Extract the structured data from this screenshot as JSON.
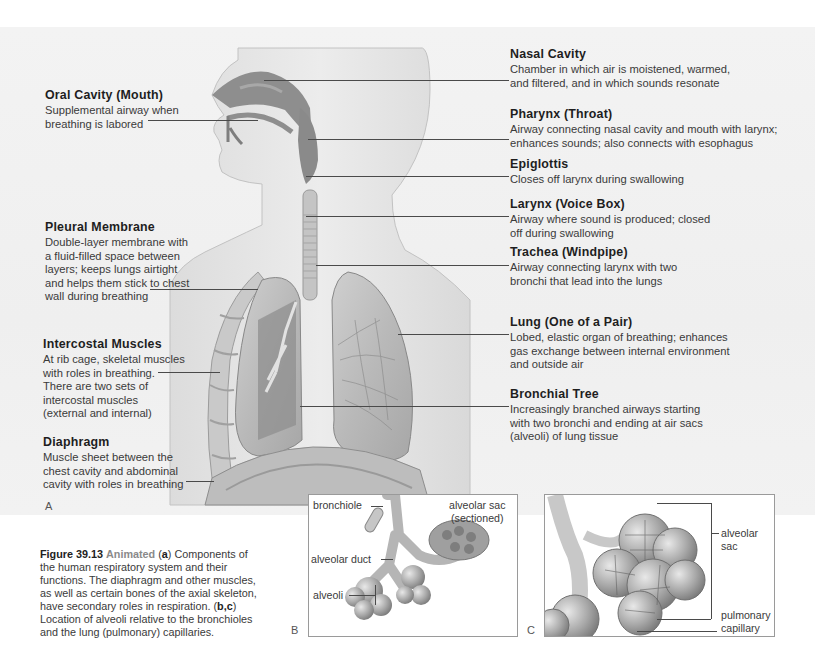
{
  "figure": {
    "number": "Figure 39.13",
    "tag": "Animated",
    "caption_parts": [
      {
        "text": "(",
        "bold": false
      },
      {
        "text": "a",
        "bold": true
      },
      {
        "text": ") Components of the human respiratory system and their functions. The diaphragm and other muscles, as well as certain bones of the axial skeleton, have secondary roles in respiration. (",
        "bold": false
      },
      {
        "text": "b,c",
        "bold": true
      },
      {
        "text": ") Location of alveoli relative to the bronchioles and the lung (pulmonary) capillaries.",
        "bold": false
      }
    ],
    "caption_text_a": "(",
    "caption_bold_a": "a",
    "caption_text_b": ") Components of the human respiratory system and their functions. The diaphragm and other muscles, as well as certain bones of the axial skeleton, have secondary roles in respiration. (",
    "caption_bold_bc": "b,c",
    "caption_text_c": ") Location of alveoli relative to the bronchioles and the lung (pulmonary) capillaries."
  },
  "panel_letters": {
    "a": "A",
    "b": "B",
    "c": "C"
  },
  "left_labels": [
    {
      "title": "Oral Cavity (Mouth)",
      "desc": "Supplemental airway when\nbreathing is labored"
    },
    {
      "title": "Pleural Membrane",
      "desc": "Double-layer membrane with\na fluid-filled space between\nlayers; keeps lungs airtight\nand helps them stick to chest\nwall during breathing"
    },
    {
      "title": "Intercostal Muscles",
      "desc": "At rib cage, skeletal muscles\nwith roles in breathing.\nThere are two sets of\nintercostal muscles\n(external and internal)"
    },
    {
      "title": "Diaphragm",
      "desc": "Muscle sheet between the\nchest cavity and abdominal\ncavity with roles in breathing"
    }
  ],
  "right_labels": [
    {
      "title": "Nasal Cavity",
      "desc": "Chamber in which air is moistened, warmed,\nand filtered, and in which sounds resonate"
    },
    {
      "title": "Pharynx (Throat)",
      "desc": "Airway connecting nasal cavity and mouth with larynx;\nenhances sounds; also connects with esophagus"
    },
    {
      "title": "Epiglottis",
      "desc": "Closes off larynx during swallowing"
    },
    {
      "title": "Larynx (Voice Box)",
      "desc": "Airway where sound is produced; closed\noff during swallowing"
    },
    {
      "title": "Trachea (Windpipe)",
      "desc": "Airway connecting larynx with two\nbronchi that lead into the lungs"
    },
    {
      "title": "Lung (One of a Pair)",
      "desc": "Lobed, elastic organ of breathing; enhances\ngas exchange between internal environment\nand outside air"
    },
    {
      "title": "Bronchial Tree",
      "desc": "Increasingly branched airways starting\nwith two bronchi and ending at air sacs\n(alveoli) of lung tissue"
    }
  ],
  "inset_b": {
    "labels": [
      "bronchiole",
      "alveolar sac\n(sectioned)",
      "alveolar duct",
      "alveoli"
    ]
  },
  "inset_c": {
    "labels": [
      "alveolar\nsac",
      "pulmonary\ncapillary"
    ]
  },
  "colors": {
    "background": "#ffffff",
    "panel_bg": "#f1f1f1",
    "text": "#3a3a3a",
    "title_text": "#1e1e1e",
    "leader": "#4a4a4a",
    "airway_dark": "#7d7d7d",
    "skin": "#e6e6e6"
  }
}
